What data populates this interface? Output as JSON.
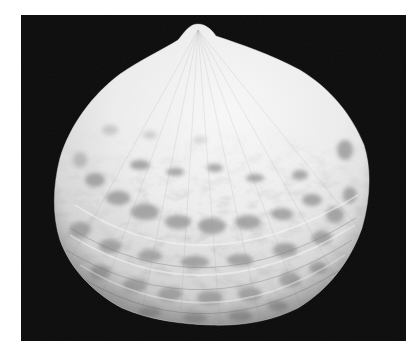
{
  "image": {
    "subject": "Bivalve seashell (single valve, exterior view) on black background",
    "alt": "Photograph of a rounded clam shell with mottled gray concentric bands on a black background",
    "colors": {
      "page_background": "#ffffff",
      "photo_background": "#0b0b0b",
      "shell_light": "#f2f2f2",
      "shell_mid": "#c8c8c8",
      "shell_patch": "#8e8e8e",
      "shell_patch_dark": "#777777"
    }
  }
}
